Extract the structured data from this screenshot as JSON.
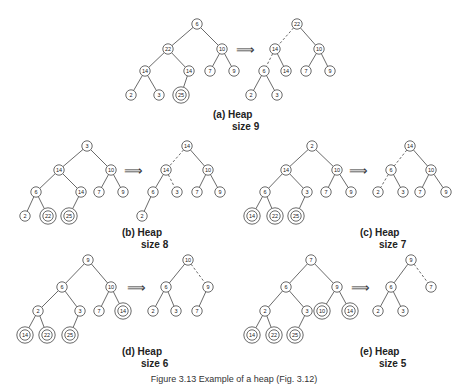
{
  "figure_caption": "Figure 3.13  Example of a heap (Fig. 3.12)",
  "arrow_glyph": "⟹",
  "panels": [
    {
      "id": "a",
      "caption_line1": "(a)  Heap",
      "caption_line2": "size 9",
      "caption_pos": [
        213,
        118
      ],
      "arrow_pos": [
        245,
        49
      ],
      "before": {
        "nodes": [
          {
            "v": "6",
            "x": 197,
            "y": 24,
            "ring": false
          },
          {
            "v": "22",
            "x": 168,
            "y": 49,
            "ring": false
          },
          {
            "v": "10",
            "x": 222,
            "y": 49,
            "ring": false
          },
          {
            "v": "14",
            "x": 145,
            "y": 71,
            "ring": false
          },
          {
            "v": "14",
            "x": 189,
            "y": 71,
            "ring": false
          },
          {
            "v": "7",
            "x": 210,
            "y": 71,
            "ring": false
          },
          {
            "v": "9",
            "x": 234,
            "y": 71,
            "ring": false
          },
          {
            "v": "2",
            "x": 131,
            "y": 95,
            "ring": false
          },
          {
            "v": "3",
            "x": 159,
            "y": 95,
            "ring": false
          },
          {
            "v": "25",
            "x": 181,
            "y": 95,
            "ring": true
          }
        ],
        "edges": [
          [
            0,
            1,
            false
          ],
          [
            0,
            2,
            false
          ],
          [
            1,
            3,
            false
          ],
          [
            1,
            4,
            false
          ],
          [
            2,
            5,
            false
          ],
          [
            2,
            6,
            false
          ],
          [
            3,
            7,
            false
          ],
          [
            3,
            8,
            false
          ],
          [
            4,
            9,
            false
          ]
        ]
      },
      "after": {
        "nodes": [
          {
            "v": "22",
            "x": 297,
            "y": 24,
            "ring": false
          },
          {
            "v": "14",
            "x": 275,
            "y": 49,
            "ring": false
          },
          {
            "v": "10",
            "x": 319,
            "y": 49,
            "ring": false
          },
          {
            "v": "6",
            "x": 264,
            "y": 71,
            "ring": false
          },
          {
            "v": "14",
            "x": 286,
            "y": 71,
            "ring": false
          },
          {
            "v": "7",
            "x": 306,
            "y": 71,
            "ring": false
          },
          {
            "v": "9",
            "x": 330,
            "y": 71,
            "ring": false
          },
          {
            "v": "2",
            "x": 251,
            "y": 95,
            "ring": false
          },
          {
            "v": "3",
            "x": 277,
            "y": 95,
            "ring": false
          }
        ],
        "edges": [
          [
            0,
            1,
            true
          ],
          [
            0,
            2,
            false
          ],
          [
            1,
            3,
            true
          ],
          [
            1,
            4,
            false
          ],
          [
            2,
            5,
            false
          ],
          [
            2,
            6,
            false
          ],
          [
            3,
            7,
            false
          ],
          [
            3,
            8,
            false
          ]
        ]
      }
    },
    {
      "id": "b",
      "caption_line1": "(b)  Heap",
      "caption_line2": "size 8",
      "caption_pos": [
        122,
        236
      ],
      "arrow_pos": [
        133,
        170
      ],
      "before": {
        "nodes": [
          {
            "v": "3",
            "x": 87,
            "y": 146,
            "ring": false
          },
          {
            "v": "14",
            "x": 59,
            "y": 170,
            "ring": false
          },
          {
            "v": "10",
            "x": 111,
            "y": 170,
            "ring": false
          },
          {
            "v": "6",
            "x": 36,
            "y": 192,
            "ring": false
          },
          {
            "v": "14",
            "x": 81,
            "y": 192,
            "ring": false
          },
          {
            "v": "7",
            "x": 99,
            "y": 192,
            "ring": false
          },
          {
            "v": "9",
            "x": 123,
            "y": 192,
            "ring": false
          },
          {
            "v": "2",
            "x": 25,
            "y": 216,
            "ring": false
          },
          {
            "v": "22",
            "x": 48,
            "y": 216,
            "ring": true
          },
          {
            "v": "25",
            "x": 69,
            "y": 216,
            "ring": true
          }
        ],
        "edges": [
          [
            0,
            1,
            false
          ],
          [
            0,
            2,
            false
          ],
          [
            1,
            3,
            false
          ],
          [
            1,
            4,
            false
          ],
          [
            2,
            5,
            false
          ],
          [
            2,
            6,
            false
          ],
          [
            3,
            7,
            false
          ],
          [
            3,
            8,
            false
          ],
          [
            4,
            9,
            false
          ]
        ]
      },
      "after": {
        "nodes": [
          {
            "v": "14",
            "x": 187,
            "y": 146,
            "ring": false
          },
          {
            "v": "14",
            "x": 166,
            "y": 170,
            "ring": false
          },
          {
            "v": "10",
            "x": 208,
            "y": 170,
            "ring": false
          },
          {
            "v": "6",
            "x": 153,
            "y": 192,
            "ring": false
          },
          {
            "v": "3",
            "x": 177,
            "y": 192,
            "ring": false
          },
          {
            "v": "7",
            "x": 197,
            "y": 192,
            "ring": false
          },
          {
            "v": "9",
            "x": 220,
            "y": 192,
            "ring": false
          },
          {
            "v": "2",
            "x": 142,
            "y": 216,
            "ring": false
          }
        ],
        "edges": [
          [
            0,
            1,
            true
          ],
          [
            0,
            2,
            false
          ],
          [
            1,
            3,
            false
          ],
          [
            1,
            4,
            true
          ],
          [
            2,
            5,
            false
          ],
          [
            2,
            6,
            false
          ],
          [
            3,
            7,
            false
          ]
        ]
      }
    },
    {
      "id": "c",
      "caption_line1": "(c)  Heap",
      "caption_line2": "size 7",
      "caption_pos": [
        360,
        236
      ],
      "arrow_pos": [
        358,
        170
      ],
      "before": {
        "nodes": [
          {
            "v": "2",
            "x": 312,
            "y": 146,
            "ring": false
          },
          {
            "v": "14",
            "x": 286,
            "y": 170,
            "ring": false
          },
          {
            "v": "10",
            "x": 337,
            "y": 170,
            "ring": false
          },
          {
            "v": "6",
            "x": 265,
            "y": 192,
            "ring": false
          },
          {
            "v": "3",
            "x": 307,
            "y": 192,
            "ring": false
          },
          {
            "v": "7",
            "x": 326,
            "y": 192,
            "ring": false
          },
          {
            "v": "9",
            "x": 351,
            "y": 192,
            "ring": false
          },
          {
            "v": "14",
            "x": 252,
            "y": 216,
            "ring": true
          },
          {
            "v": "22",
            "x": 275,
            "y": 216,
            "ring": true
          },
          {
            "v": "25",
            "x": 296,
            "y": 216,
            "ring": true
          }
        ],
        "edges": [
          [
            0,
            1,
            false
          ],
          [
            0,
            2,
            false
          ],
          [
            1,
            3,
            false
          ],
          [
            1,
            4,
            false
          ],
          [
            2,
            5,
            false
          ],
          [
            2,
            6,
            false
          ],
          [
            3,
            7,
            false
          ],
          [
            3,
            8,
            false
          ],
          [
            4,
            9,
            false
          ]
        ]
      },
      "after": {
        "nodes": [
          {
            "v": "14",
            "x": 410,
            "y": 146,
            "ring": false
          },
          {
            "v": "6",
            "x": 391,
            "y": 170,
            "ring": false
          },
          {
            "v": "10",
            "x": 431,
            "y": 170,
            "ring": false
          },
          {
            "v": "2",
            "x": 378,
            "y": 192,
            "ring": false
          },
          {
            "v": "3",
            "x": 403,
            "y": 192,
            "ring": false
          },
          {
            "v": "7",
            "x": 420,
            "y": 192,
            "ring": false
          },
          {
            "v": "9",
            "x": 446,
            "y": 192,
            "ring": false
          }
        ],
        "edges": [
          [
            0,
            1,
            true
          ],
          [
            0,
            2,
            false
          ],
          [
            1,
            3,
            true
          ],
          [
            1,
            4,
            false
          ],
          [
            2,
            5,
            false
          ],
          [
            2,
            6,
            false
          ]
        ]
      }
    },
    {
      "id": "d",
      "caption_line1": "(d)  Heap",
      "caption_line2": "size 6",
      "caption_pos": [
        122,
        355
      ],
      "arrow_pos": [
        136,
        287
      ],
      "before": {
        "nodes": [
          {
            "v": "9",
            "x": 88,
            "y": 260,
            "ring": false
          },
          {
            "v": "6",
            "x": 62,
            "y": 287,
            "ring": false
          },
          {
            "v": "10",
            "x": 111,
            "y": 287,
            "ring": false
          },
          {
            "v": "2",
            "x": 38,
            "y": 311,
            "ring": false
          },
          {
            "v": "3",
            "x": 80,
            "y": 311,
            "ring": false
          },
          {
            "v": "7",
            "x": 99,
            "y": 311,
            "ring": false
          },
          {
            "v": "14",
            "x": 123,
            "y": 311,
            "ring": true
          },
          {
            "v": "14",
            "x": 25,
            "y": 335,
            "ring": true
          },
          {
            "v": "22",
            "x": 47,
            "y": 335,
            "ring": true
          },
          {
            "v": "25",
            "x": 70,
            "y": 335,
            "ring": true
          }
        ],
        "edges": [
          [
            0,
            1,
            false
          ],
          [
            0,
            2,
            false
          ],
          [
            1,
            3,
            false
          ],
          [
            1,
            4,
            false
          ],
          [
            2,
            5,
            false
          ],
          [
            2,
            6,
            false
          ],
          [
            3,
            7,
            false
          ],
          [
            3,
            8,
            false
          ],
          [
            4,
            9,
            false
          ]
        ]
      },
      "after": {
        "nodes": [
          {
            "v": "10",
            "x": 188,
            "y": 260,
            "ring": false
          },
          {
            "v": "6",
            "x": 166,
            "y": 287,
            "ring": false
          },
          {
            "v": "9",
            "x": 208,
            "y": 287,
            "ring": false
          },
          {
            "v": "2",
            "x": 153,
            "y": 311,
            "ring": false
          },
          {
            "v": "3",
            "x": 176,
            "y": 311,
            "ring": false
          },
          {
            "v": "7",
            "x": 197,
            "y": 311,
            "ring": false
          }
        ],
        "edges": [
          [
            0,
            1,
            false
          ],
          [
            0,
            2,
            true
          ],
          [
            1,
            3,
            false
          ],
          [
            1,
            4,
            false
          ],
          [
            2,
            5,
            false
          ]
        ]
      }
    },
    {
      "id": "e",
      "caption_line1": "(e)  Heap",
      "caption_line2": "size 5",
      "caption_pos": [
        360,
        355
      ],
      "arrow_pos": [
        360,
        287
      ],
      "before": {
        "nodes": [
          {
            "v": "7",
            "x": 311,
            "y": 260,
            "ring": false
          },
          {
            "v": "6",
            "x": 286,
            "y": 287,
            "ring": false
          },
          {
            "v": "9",
            "x": 337,
            "y": 287,
            "ring": false
          },
          {
            "v": "2",
            "x": 265,
            "y": 311,
            "ring": false
          },
          {
            "v": "3",
            "x": 307,
            "y": 311,
            "ring": false
          },
          {
            "v": "10",
            "x": 322,
            "y": 311,
            "ring": true
          },
          {
            "v": "14",
            "x": 350,
            "y": 311,
            "ring": true
          },
          {
            "v": "14",
            "x": 252,
            "y": 335,
            "ring": true
          },
          {
            "v": "22",
            "x": 274,
            "y": 335,
            "ring": true
          },
          {
            "v": "25",
            "x": 295,
            "y": 335,
            "ring": true
          }
        ],
        "edges": [
          [
            0,
            1,
            false
          ],
          [
            0,
            2,
            false
          ],
          [
            1,
            3,
            false
          ],
          [
            1,
            4,
            false
          ],
          [
            2,
            5,
            false
          ],
          [
            2,
            6,
            false
          ],
          [
            3,
            7,
            false
          ],
          [
            3,
            8,
            false
          ],
          [
            4,
            9,
            false
          ]
        ]
      },
      "after": {
        "nodes": [
          {
            "v": "9",
            "x": 411,
            "y": 260,
            "ring": false
          },
          {
            "v": "6",
            "x": 391,
            "y": 287,
            "ring": false
          },
          {
            "v": "7",
            "x": 431,
            "y": 287,
            "ring": false
          },
          {
            "v": "2",
            "x": 378,
            "y": 311,
            "ring": false
          },
          {
            "v": "3",
            "x": 403,
            "y": 311,
            "ring": false
          }
        ],
        "edges": [
          [
            0,
            1,
            false
          ],
          [
            0,
            2,
            true
          ],
          [
            1,
            3,
            false
          ],
          [
            1,
            4,
            false
          ]
        ]
      }
    }
  ]
}
